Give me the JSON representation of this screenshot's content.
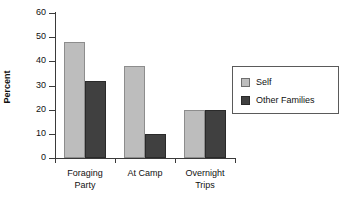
{
  "chart_data": {
    "type": "bar",
    "title": "",
    "xlabel": "",
    "ylabel": "Percent",
    "ylim": [
      0,
      60
    ],
    "ytick_step": 10,
    "yticks": [
      "60",
      "50",
      "40",
      "30",
      "20",
      "10",
      "0"
    ],
    "grid": false,
    "legend_position": "right",
    "categories": [
      "Foraging Party",
      "At Camp",
      "Overnight Trips"
    ],
    "category_lines": [
      {
        "line1": "Foraging",
        "line2": "Party"
      },
      {
        "line1": "At Camp",
        "line2": ""
      },
      {
        "line1": "Overnight",
        "line2": "Trips"
      }
    ],
    "series": [
      {
        "name": "Self",
        "color": "#bdbdbd",
        "values": [
          48,
          38,
          20
        ]
      },
      {
        "name": "Other Families",
        "color": "#404040",
        "values": [
          32,
          10,
          20
        ]
      }
    ]
  },
  "legend": {
    "items": [
      {
        "label": "Self",
        "swatch": "self-color-swatch"
      },
      {
        "label": "Other Families",
        "swatch": "other-families-color-swatch"
      }
    ]
  },
  "colors": {
    "self": "#bdbdbd",
    "other_families": "#404040",
    "axis": "#3a3a3a",
    "text": "#111111",
    "background": "#ffffff"
  }
}
